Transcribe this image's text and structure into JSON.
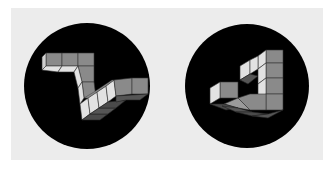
{
  "figure": {
    "panel_color": "#ececec",
    "disc_color": "#000000",
    "face_colors": {
      "light": "#e2e2e2",
      "mid": "#8a8a8a",
      "dark": "#4a4a4a",
      "edge": "#2a2a2a"
    },
    "items": [
      {
        "label": "",
        "shape": "impossible-staircase-z",
        "center": [
          87,
          86
        ],
        "radius": 63
      },
      {
        "label": "",
        "shape": "impossible-triangle-steps",
        "center": [
          247,
          86
        ],
        "radius": 62
      }
    ]
  }
}
